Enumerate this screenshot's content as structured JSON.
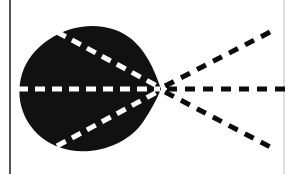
{
  "figure": {
    "kind": "scanned-diagram",
    "title": "Radiation lobe pattern with dashed beam axes",
    "description": "Solid dark teardrop lobe on white paper with dashed lines radiating from a focal point at the right tip of the lobe.",
    "canvas": {
      "width": 290,
      "height": 174
    },
    "colors": {
      "paper": "#ffffff",
      "ink": "#0b0b0b",
      "lobe_fill": "#111111",
      "dash_light": "#ffffff",
      "dash_dark": "#0b0b0b",
      "rule_line": "#3a3a3a",
      "rule_line_faint": "#b9b9b9"
    },
    "focus_point": {
      "x": 161,
      "y": 89,
      "label": "focal-point"
    },
    "lobe": {
      "name": "main-lobe",
      "fill": "#111111",
      "left_extent_x": 20,
      "right_tip_x": 161,
      "top_extent_y": 26,
      "bottom_extent_y": 152,
      "center": {
        "x": 88,
        "y": 89
      },
      "radius_x": 70,
      "radius_y": 63,
      "path": "M 161 89 C 150 56 135 32 104 27 C 70 21 32 42 22 74 C 13 104 28 134 56 146 C 86 159 126 147 143 122 C 151 110 157 99 161 89 Z"
    },
    "inner_dashes": [
      {
        "name": "inner-axis-horizontal",
        "color": "#ffffff",
        "x1": 18,
        "y1": 89,
        "x2": 160,
        "y2": 89,
        "dash": "10 7",
        "width": 5
      },
      {
        "name": "inner-axis-upper",
        "color": "#ffffff",
        "x1": 57,
        "y1": 32,
        "x2": 159,
        "y2": 87,
        "dash": "10 7",
        "width": 5
      },
      {
        "name": "inner-axis-lower",
        "color": "#ffffff",
        "x1": 57,
        "y1": 146,
        "x2": 159,
        "y2": 91,
        "dash": "10 7",
        "width": 5
      }
    ],
    "outer_dashes": [
      {
        "name": "outer-axis-horizontal",
        "color": "#0b0b0b",
        "x1": 167,
        "y1": 89,
        "x2": 288,
        "y2": 89,
        "dash": "10 8",
        "width": 5
      },
      {
        "name": "outer-axis-upper",
        "color": "#0b0b0b",
        "x1": 165,
        "y1": 86,
        "x2": 276,
        "y2": 29,
        "dash": "10 8",
        "width": 5
      },
      {
        "name": "outer-axis-lower",
        "color": "#0b0b0b",
        "x1": 165,
        "y1": 92,
        "x2": 276,
        "y2": 150,
        "dash": "10 8",
        "width": 5
      }
    ],
    "rules": [
      {
        "name": "left-margin-rule",
        "color": "#3a3a3a",
        "x": 10,
        "y1": 0,
        "y2": 174,
        "width": 2,
        "opacity": 0.85
      },
      {
        "name": "right-margin-rule",
        "color": "#b9b9b9",
        "x": 284,
        "y1": 0,
        "y2": 174,
        "width": 1.5,
        "opacity": 0.6
      }
    ]
  }
}
